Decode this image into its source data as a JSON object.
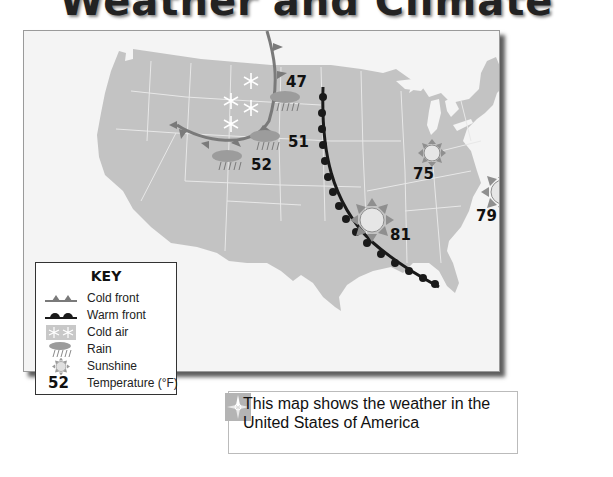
{
  "title": "Weather and Climate Maps",
  "map": {
    "region": "United States of America",
    "temperatures": [
      {
        "value": "47",
        "x": 288,
        "y": 44
      },
      {
        "value": "51",
        "x": 288,
        "y": 104
      },
      {
        "value": "52",
        "x": 251,
        "y": 157
      },
      {
        "value": "81",
        "x": 392,
        "y": 228
      },
      {
        "value": "75",
        "x": 413,
        "y": 166
      },
      {
        "value": "79",
        "x": 476,
        "y": 208
      }
    ],
    "weather_symbols": {
      "cold_air": [
        {
          "x": 232,
          "y": 100
        },
        {
          "x": 246,
          "y": 84
        }
      ],
      "rain": [
        {
          "x": 285,
          "y": 73
        },
        {
          "x": 265,
          "y": 108
        },
        {
          "x": 228,
          "y": 132
        }
      ],
      "sunshine": [
        {
          "x": 371,
          "y": 219,
          "size": "large"
        },
        {
          "x": 431,
          "y": 153,
          "size": "small"
        },
        {
          "x": 502,
          "y": 192,
          "size": "large"
        }
      ]
    },
    "fronts": [
      {
        "type": "cold front",
        "color": "#7a7a7a"
      },
      {
        "type": "warm front",
        "color": "#1a1a1a"
      }
    ],
    "colors": {
      "land": "#c3c3c3",
      "state_border": "#e8e8e8",
      "water": "#f4f4f4",
      "sun_fill": "#e6e6e6",
      "sun_rays": "#8f8f8f",
      "cloud": "#9c9c9c"
    }
  },
  "key": {
    "title": "KEY",
    "items": [
      {
        "symbol": "cold-front",
        "label": "Cold front"
      },
      {
        "symbol": "warm-front",
        "label": "Warm front"
      },
      {
        "symbol": "cold-air",
        "label": "Cold air"
      },
      {
        "symbol": "rain",
        "label": "Rain"
      },
      {
        "symbol": "sunshine",
        "label": "Sunshine"
      },
      {
        "symbol": "temperature",
        "sample": "52",
        "label": "Temperature (°F)"
      }
    ]
  },
  "caption": {
    "icon": "compass-icon",
    "text": "This map shows the weather in the United States of America"
  }
}
